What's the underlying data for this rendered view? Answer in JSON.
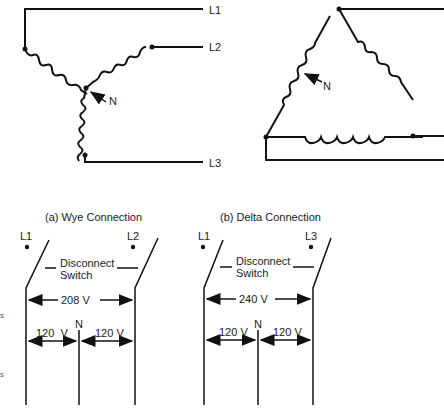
{
  "wye_diagram": {
    "lines": [
      "L1",
      "L2",
      "L3"
    ],
    "neutral": "N"
  },
  "delta_diagram": {
    "neutral": "N"
  },
  "panel_a": {
    "title": "(a) Wye Connection",
    "left_line": "L1",
    "right_line": "L2",
    "switch_label_1": "Disconnect",
    "switch_label_2": "Switch",
    "line_voltage": "208 V",
    "neutral": "N",
    "left_voltage": "120  V",
    "right_voltage": "120 V"
  },
  "panel_b": {
    "title": "(b) Delta Connection",
    "left_line": "L1",
    "right_line": "L3",
    "switch_label_1": "Disconnect",
    "switch_label_2": "Switch",
    "line_voltage": "240 V",
    "neutral": "N",
    "left_voltage": "120 V",
    "right_voltage": "120 V"
  }
}
